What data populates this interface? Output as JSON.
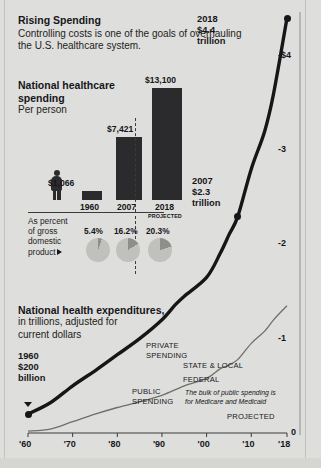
{
  "header": {
    "title": "Rising Spending",
    "subtitle": "Controlling costs is one of the goals of overhauling the U.S. healthcare system."
  },
  "bar_section": {
    "title_line1": "National healthcare",
    "title_line2": "spending",
    "subtitle": "Per person",
    "projected_note": "PROJECTED",
    "gdp_label_line1": "As percent",
    "gdp_label_line2": "of gross",
    "gdp_label_line3": "domestic",
    "gdp_label_line4": "product"
  },
  "line_section": {
    "title_line1": "National health expenditures,",
    "title_line2": "in trillions, adjusted for",
    "title_line3": "current dollars",
    "private_label_line1": "PRIVATE",
    "private_label_line2": "SPENDING",
    "public_label_line1": "PUBLIC",
    "public_label_line2": "SPENDING",
    "state_local_label": "STATE & LOCAL",
    "federal_label": "FEDERAL",
    "note_line1": "The bulk of public spending is",
    "note_line2": "for Medicare and Medicaid",
    "projected_label": "PROJECTED",
    "callout_1960_line1": "1960",
    "callout_1960_line2": "$200",
    "callout_1960_line3": "billion",
    "callout_2007_line1": "2007",
    "callout_2007_line2": "$2.3",
    "callout_2007_line3": "trillion",
    "callout_2018_line1": "2018",
    "callout_2018_line2": "$4.4",
    "callout_2018_line3": "trillion"
  },
  "colors": {
    "background": "#dededc",
    "bar_fill": "#2b2b2e",
    "pie_base": "#c0c0bd",
    "pie_wedge": "#8e8e8b",
    "total_line": "#161618",
    "public_line": "#6e6e6b",
    "text": "#16161a"
  },
  "chart_data": [
    {
      "type": "bar",
      "title": "National healthcare spending",
      "subtitle": "Per person",
      "categories": [
        "1960",
        "2007",
        "2018"
      ],
      "values": [
        1066,
        7421,
        13100
      ],
      "value_labels": [
        "$1,066",
        "$7,421",
        "$13,100"
      ],
      "projected_categories": [
        "2018"
      ],
      "ylim": [
        0,
        13100
      ],
      "xlabel": "",
      "ylabel": "",
      "grid": false
    },
    {
      "type": "pie",
      "title": "As percent of gross domestic product",
      "categories": [
        "1960",
        "2007",
        "2018"
      ],
      "values": [
        5.4,
        16.2,
        20.3
      ],
      "value_labels": [
        "5.4%",
        "16.2%",
        "20.3%"
      ],
      "units": "percent of GDP"
    },
    {
      "type": "line",
      "title": "National health expenditures, in trillions, adjusted for current dollars",
      "xlabel": "",
      "ylabel": "trillions of dollars",
      "xlim": [
        1960,
        2018
      ],
      "ylim": [
        0,
        4.4
      ],
      "xticks": [
        1960,
        1970,
        1980,
        1990,
        2000,
        2010,
        2018
      ],
      "xticklabels": [
        "'60",
        "'70",
        "'80",
        "'90",
        "'00",
        "'10",
        "'18"
      ],
      "yticks": [
        0,
        1,
        2,
        3,
        4
      ],
      "yticklabels": [
        "0",
        "-1",
        "-2",
        "-3",
        "-$4"
      ],
      "grid": false,
      "legend": "inline annotations",
      "annotations": [
        {
          "label": "1960 $200 billion",
          "x": 1960,
          "y": 0.2
        },
        {
          "label": "2007 $2.3 trillion",
          "x": 2007,
          "y": 2.3
        },
        {
          "label": "2018 $4.4 trillion",
          "x": 2018,
          "y": 4.4
        },
        {
          "label": "PROJECTED",
          "x": 2014,
          "y": 0.0
        }
      ],
      "series": [
        {
          "name": "Total national health expenditures",
          "x": [
            1960,
            1965,
            1970,
            1975,
            1980,
            1985,
            1990,
            1993,
            1995,
            2000,
            2003,
            2005,
            2007,
            2010,
            2013,
            2015,
            2018
          ],
          "values": [
            0.2,
            0.32,
            0.5,
            0.66,
            0.83,
            1.0,
            1.2,
            1.36,
            1.45,
            1.65,
            1.9,
            2.1,
            2.3,
            2.8,
            3.2,
            3.6,
            4.4
          ]
        },
        {
          "name": "Public spending",
          "x": [
            1960,
            1965,
            1970,
            1975,
            1980,
            1985,
            1990,
            1995,
            2000,
            2003,
            2005,
            2007,
            2010,
            2013,
            2015,
            2018
          ],
          "values": [
            0.02,
            0.04,
            0.12,
            0.2,
            0.27,
            0.33,
            0.4,
            0.5,
            0.58,
            0.68,
            0.72,
            0.78,
            0.95,
            1.08,
            1.2,
            1.35
          ]
        }
      ]
    }
  ]
}
